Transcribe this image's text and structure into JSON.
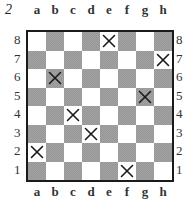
{
  "diagram": {
    "number": "2",
    "files": [
      "a",
      "b",
      "c",
      "d",
      "e",
      "f",
      "g",
      "h"
    ],
    "ranks": [
      "8",
      "7",
      "6",
      "5",
      "4",
      "3",
      "2",
      "1"
    ],
    "marked_squares": [
      "e8",
      "h7",
      "b6",
      "g5",
      "c4",
      "d3",
      "a2",
      "f1"
    ],
    "colors": {
      "light_square": "#ffffff",
      "dark_square": "#a3a3a3",
      "border": "#1a1a1a",
      "mark": "#1a1a1a"
    }
  }
}
